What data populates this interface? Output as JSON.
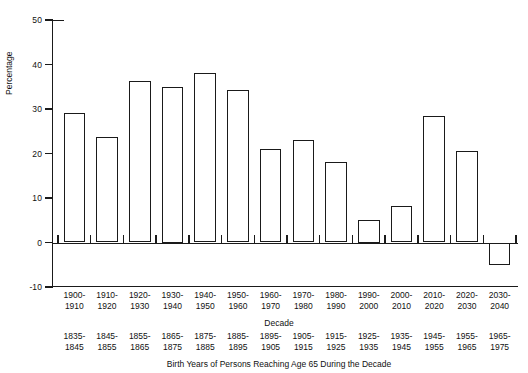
{
  "chart_data": {
    "type": "bar",
    "title": "",
    "subtitle": "",
    "xlabel": "Decade",
    "ylabel": "Percentage",
    "ylim": [
      -10,
      50
    ],
    "yticks": [
      -10,
      0,
      10,
      20,
      30,
      40,
      50
    ],
    "ytick_labels": [
      "-10",
      "0",
      "10",
      "20",
      "30",
      "40",
      "50"
    ],
    "grid": false,
    "legend": null,
    "caption": "Birth Years of Persons Reaching Age 65 During the Decade",
    "categories": [
      "1900-\n1910",
      "1910-\n1920",
      "1920-\n1930",
      "1930-\n1940",
      "1940-\n1950",
      "1950-\n1960",
      "1960-\n1970",
      "1970-\n1980",
      "1980-\n1990",
      "1990-\n2000",
      "2000-\n2010",
      "2010-\n2020",
      "2020-\n2030",
      "2030-\n2040"
    ],
    "values": [
      29,
      23.8,
      36.3,
      35,
      38,
      34.3,
      21,
      23,
      18,
      5,
      8.2,
      28.5,
      20.6,
      -5
    ],
    "secondary_axis_label": "Birth Years",
    "secondary_categories": [
      "1835-\n1845",
      "1845-\n1855",
      "1855-\n1865",
      "1865-\n1875",
      "1875-\n1885",
      "1885-\n1895",
      "1895-\n1905",
      "1905-\n1915",
      "1915-\n1925",
      "1925-\n1935",
      "1935-\n1945",
      "1945-\n1955",
      "1955-\n1965",
      "1965-\n1975"
    ]
  },
  "axis": {
    "y_label": "Percentage",
    "x_label": "Decade",
    "caption": "Birth Years of Persons Reaching Age 65 During the Decade",
    "ticks": {
      "t50": "50",
      "t40": "40",
      "t30": "30",
      "t20": "20",
      "t10": "10",
      "t0": "0",
      "tm10": "-10"
    }
  },
  "decades": [
    {
      "top": "1900-",
      "bottom": "1910",
      "birth_top": "1835-",
      "birth_bottom": "1845",
      "value": 29
    },
    {
      "top": "1910-",
      "bottom": "1920",
      "birth_top": "1845-",
      "birth_bottom": "1855",
      "value": 23.8
    },
    {
      "top": "1920-",
      "bottom": "1930",
      "birth_top": "1855-",
      "birth_bottom": "1865",
      "value": 36.3
    },
    {
      "top": "1930-",
      "bottom": "1940",
      "birth_top": "1865-",
      "birth_bottom": "1875",
      "value": 35
    },
    {
      "top": "1940-",
      "bottom": "1950",
      "birth_top": "1875-",
      "birth_bottom": "1885",
      "value": 38
    },
    {
      "top": "1950-",
      "bottom": "1960",
      "birth_top": "1885-",
      "birth_bottom": "1895",
      "value": 34.3
    },
    {
      "top": "1960-",
      "bottom": "1970",
      "birth_top": "1895-",
      "birth_bottom": "1905",
      "value": 21
    },
    {
      "top": "1970-",
      "bottom": "1980",
      "birth_top": "1905-",
      "birth_bottom": "1915",
      "value": 23
    },
    {
      "top": "1980-",
      "bottom": "1990",
      "birth_top": "1915-",
      "birth_bottom": "1925",
      "value": 18
    },
    {
      "top": "1990-",
      "bottom": "2000",
      "birth_top": "1925-",
      "birth_bottom": "1935",
      "value": 5
    },
    {
      "top": "2000-",
      "bottom": "2010",
      "birth_top": "1935-",
      "birth_bottom": "1945",
      "value": 8.2
    },
    {
      "top": "2010-",
      "bottom": "2020",
      "birth_top": "1945-",
      "birth_bottom": "1955",
      "value": 28.5
    },
    {
      "top": "2020-",
      "bottom": "2030",
      "birth_top": "1955-",
      "birth_bottom": "1965",
      "value": 20.6
    },
    {
      "top": "2030-",
      "bottom": "2040",
      "birth_top": "1965-",
      "birth_bottom": "1975",
      "value": -5
    }
  ]
}
